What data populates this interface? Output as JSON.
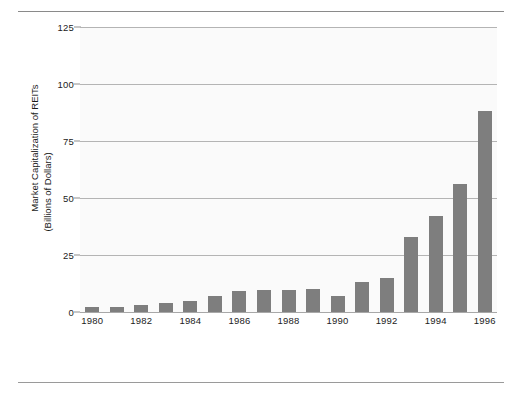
{
  "chart_data": {
    "type": "bar",
    "title": "",
    "subtitle": "",
    "xlabel": "",
    "ylabel": "Market Capitalization of REITs (Billions of Dollars)",
    "ylabel_line1": "Market Capitalization of REITs",
    "ylabel_line2": "(Billions of Dollars)",
    "ylim": [
      0,
      125
    ],
    "yticks": [
      0,
      25,
      50,
      75,
      100,
      125
    ],
    "ytick_labels": [
      "0",
      "25",
      "50",
      "75",
      "100",
      "125"
    ],
    "grid": true,
    "legend": "none",
    "bar_color": "#7e7e7e",
    "plot_background": "#fafafa",
    "gridline_color": "#b4b4b4",
    "categories": [
      "1980",
      "1981",
      "1982",
      "1983",
      "1984",
      "1985",
      "1986",
      "1987",
      "1988",
      "1989",
      "1990",
      "1991",
      "1992",
      "1993",
      "1994",
      "1995",
      "1996"
    ],
    "xtick_labels": [
      "1980",
      "1982",
      "1984",
      "1986",
      "1988",
      "1990",
      "1992",
      "1994",
      "1996"
    ],
    "values": [
      2.3,
      2.4,
      3.0,
      3.8,
      5.0,
      7.1,
      9.4,
      9.7,
      9.6,
      9.9,
      7.0,
      13.0,
      15.0,
      33.0,
      42.0,
      56.0,
      88.0
    ]
  }
}
